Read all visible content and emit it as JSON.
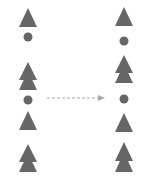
{
  "diagram": {
    "colors": {
      "shape": "#666666",
      "arrow": "#a8a8a8",
      "background": "#ffffff"
    },
    "left_column": [
      {
        "shape": "triangle",
        "cy": 17
      },
      {
        "shape": "dot",
        "cy": 36
      },
      {
        "shape": "double-triangle",
        "cy": 76
      },
      {
        "shape": "dot",
        "cy": 100
      },
      {
        "shape": "triangle",
        "cy": 121
      },
      {
        "shape": "double-triangle",
        "cy": 158
      }
    ],
    "right_column": [
      {
        "shape": "triangle",
        "cy": 17
      },
      {
        "shape": "dot",
        "cy": 41
      },
      {
        "shape": "double-triangle",
        "cy": 69
      },
      {
        "shape": "dot",
        "cy": 99
      },
      {
        "shape": "triangle",
        "cy": 122
      },
      {
        "shape": "double-triangle",
        "cy": 157
      }
    ],
    "arrow": {
      "style": "dashed",
      "direction": "right"
    }
  }
}
